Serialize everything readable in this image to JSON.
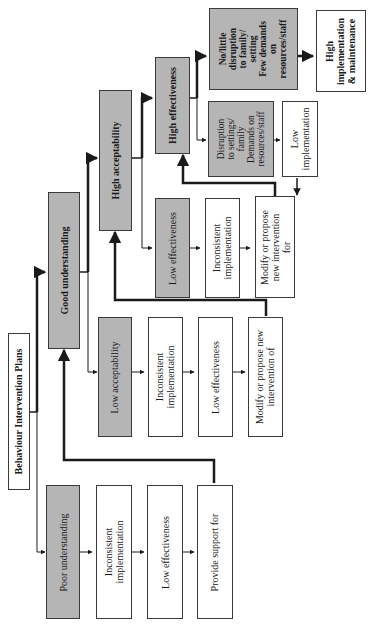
{
  "diagram": {
    "title": "Behaviour Intervention Plans",
    "orientation": "rotated 90 degrees counter-clockwise",
    "nodes": {
      "root": "Behaviour Intervention Plans",
      "poor_understanding": "Poor understanding",
      "poor_inconsistent": "Inconsistent\nimplementation",
      "poor_low_effectiveness": "Low effectiveness",
      "provide_support": "Provide support for",
      "good_understanding": "Good understanding",
      "low_acceptability": "Low acceptability",
      "la_inconsistent": "Inconsistent\nimplementation",
      "la_low_effectiveness": "Low effectiveness",
      "la_modify": "Modify or propose new\nintervention of",
      "high_acceptability": "High acceptability",
      "low_effectiveness": "Low effectiveness",
      "le_inconsistent": "Inconsistent\nimplementation",
      "le_modify": "Modify or propose\nnew intervention\nfor",
      "high_effectiveness": "High effectiveness",
      "disruption": "Disruption\nto settings/\nfamily\nDemands on\nresources/staff",
      "low_implementation": "Low\nimplementation",
      "no_disruption": "No/little\ndisruption\nto family/\nsetting\nFew demands\non\nresources/staff",
      "high_implementation": "High\nimplementation\n& maintenance"
    },
    "edges": [
      {
        "from": "root",
        "to": "poor_understanding"
      },
      {
        "from": "root",
        "to": "good_understanding"
      },
      {
        "from": "poor_understanding",
        "to": "poor_inconsistent"
      },
      {
        "from": "poor_inconsistent",
        "to": "poor_low_effectiveness"
      },
      {
        "from": "poor_low_effectiveness",
        "to": "provide_support"
      },
      {
        "from": "provide_support",
        "to": "good_understanding",
        "type": "feedback"
      },
      {
        "from": "good_understanding",
        "to": "high_acceptability"
      },
      {
        "from": "good_understanding",
        "to": "low_acceptability"
      },
      {
        "from": "low_acceptability",
        "to": "la_inconsistent"
      },
      {
        "from": "la_inconsistent",
        "to": "la_low_effectiveness"
      },
      {
        "from": "la_low_effectiveness",
        "to": "la_modify"
      },
      {
        "from": "la_modify",
        "to": "high_acceptability",
        "type": "feedback"
      },
      {
        "from": "high_acceptability",
        "to": "high_effectiveness"
      },
      {
        "from": "high_acceptability",
        "to": "low_effectiveness"
      },
      {
        "from": "low_effectiveness",
        "to": "le_inconsistent"
      },
      {
        "from": "le_inconsistent",
        "to": "le_modify"
      },
      {
        "from": "le_modify",
        "to": "high_effectiveness",
        "type": "feedback"
      },
      {
        "from": "high_effectiveness",
        "to": "no_disruption"
      },
      {
        "from": "high_effectiveness",
        "to": "disruption"
      },
      {
        "from": "disruption",
        "to": "low_implementation"
      },
      {
        "from": "low_implementation",
        "to": "le_modify"
      },
      {
        "from": "no_disruption",
        "to": "high_implementation"
      }
    ],
    "colors": {
      "grey_fill": "#b5b5b5",
      "white_fill": "#ffffff",
      "stroke": "#1a1a1a"
    }
  }
}
